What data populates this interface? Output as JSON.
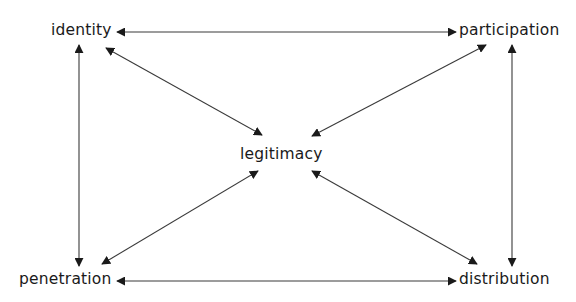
{
  "diagram": {
    "type": "concept-relationship",
    "nodes": {
      "identity": {
        "label": "identity"
      },
      "participation": {
        "label": "participation"
      },
      "legitimacy": {
        "label": "legitimacy"
      },
      "penetration": {
        "label": "penetration"
      },
      "distribution": {
        "label": "distribution"
      }
    },
    "edges": [
      {
        "from": "identity",
        "to": "participation",
        "direction": "bidirectional"
      },
      {
        "from": "identity",
        "to": "penetration",
        "direction": "bidirectional"
      },
      {
        "from": "participation",
        "to": "distribution",
        "direction": "bidirectional"
      },
      {
        "from": "penetration",
        "to": "distribution",
        "direction": "bidirectional"
      },
      {
        "from": "identity",
        "to": "legitimacy",
        "direction": "bidirectional"
      },
      {
        "from": "participation",
        "to": "legitimacy",
        "direction": "bidirectional"
      },
      {
        "from": "penetration",
        "to": "legitimacy",
        "direction": "bidirectional"
      },
      {
        "from": "distribution",
        "to": "legitimacy",
        "direction": "bidirectional"
      }
    ],
    "colors": {
      "line": "#3a3a3a",
      "arrowhead": "#1a1a1a",
      "text": "#1a1a1a",
      "background": "#ffffff"
    }
  }
}
